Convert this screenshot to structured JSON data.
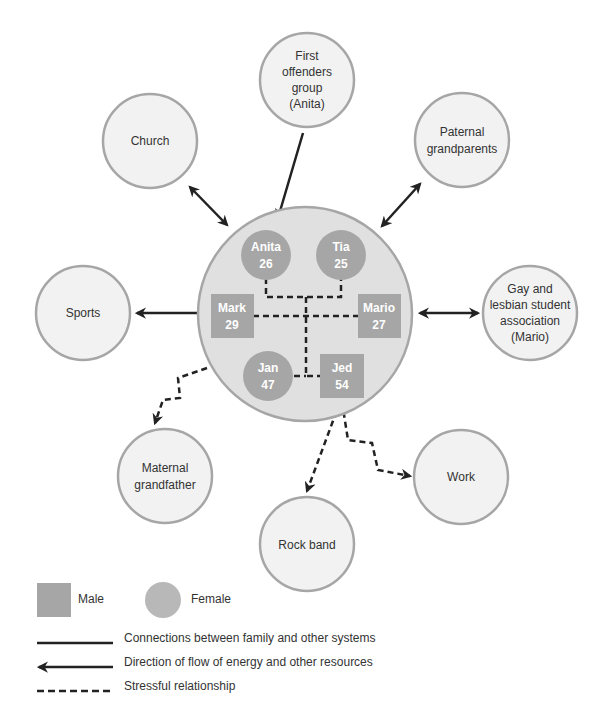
{
  "colors": {
    "outer_circle_fill": "#f2f2f2",
    "outer_circle_stroke": "#a6a6a6",
    "family_circle_fill": "#e0e0e0",
    "member_fill": "#a6a6a6",
    "line": "#222222",
    "text": "#333333"
  },
  "family": {
    "members": [
      {
        "id": "anita",
        "name": "Anita",
        "age": "26",
        "sex": "female"
      },
      {
        "id": "tia",
        "name": "Tia",
        "age": "25",
        "sex": "female"
      },
      {
        "id": "mark",
        "name": "Mark",
        "age": "29",
        "sex": "male"
      },
      {
        "id": "mario",
        "name": "Mario",
        "age": "27",
        "sex": "male"
      },
      {
        "id": "jan",
        "name": "Jan",
        "age": "47",
        "sex": "female"
      },
      {
        "id": "jed",
        "name": "Jed",
        "age": "54",
        "sex": "male"
      }
    ]
  },
  "systems": [
    {
      "id": "first-offenders",
      "lines": [
        "First",
        "offenders",
        "group",
        "(Anita)"
      ],
      "relation": "flow-to-family"
    },
    {
      "id": "church",
      "lines": [
        "Church"
      ],
      "relation": "two-way"
    },
    {
      "id": "paternal-grandparents",
      "lines": [
        "Paternal",
        "grandparents"
      ],
      "relation": "two-way"
    },
    {
      "id": "sports",
      "lines": [
        "Sports"
      ],
      "relation": "flow-from-family"
    },
    {
      "id": "gay-lesbian-association",
      "lines": [
        "Gay and",
        "lesbian student",
        "association",
        "(Mario)"
      ],
      "relation": "two-way"
    },
    {
      "id": "maternal-grandfather",
      "lines": [
        "Maternal",
        "grandfather"
      ],
      "relation": "stressful"
    },
    {
      "id": "rock-band",
      "lines": [
        "Rock band"
      ],
      "relation": "stressful"
    },
    {
      "id": "work",
      "lines": [
        "Work"
      ],
      "relation": "stressful"
    }
  ],
  "legend": {
    "male": "Male",
    "female": "Female",
    "connections": "Connections between family and other systems",
    "flow": "Direction of flow of energy and other resources",
    "stressful": "Stressful relationship"
  }
}
